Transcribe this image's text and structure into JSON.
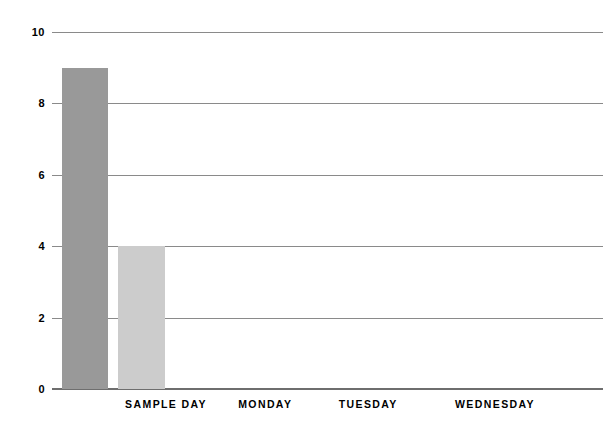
{
  "chart_data": {
    "type": "bar",
    "title": "",
    "subtitle": "",
    "xlabel": "",
    "ylabel": "",
    "categories": [
      "SAMPLE DAY",
      "MONDAY",
      "TUESDAY",
      "WEDNESDAY"
    ],
    "series": [
      {
        "name": "series-1",
        "color": "#999999",
        "values": [
          9,
          null,
          null,
          null
        ]
      },
      {
        "name": "series-2",
        "color": "#cccccc",
        "values": [
          4,
          null,
          null,
          null
        ]
      }
    ],
    "ylim": [
      0,
      10
    ],
    "yticks": [
      0,
      2,
      4,
      6,
      8,
      10
    ],
    "ytick_labels": [
      "0",
      "2",
      "4",
      "6",
      "8",
      "10"
    ],
    "grid": true,
    "grid_color": "#8a8a8a",
    "baseline_color": "#6e6e6e",
    "legend": false,
    "legend_position": "none",
    "background": "#ffffff",
    "annotations": []
  },
  "axis": {
    "y_ticks": [
      {
        "value": 10,
        "label": "10"
      },
      {
        "value": 8,
        "label": "8"
      },
      {
        "value": 6,
        "label": "6"
      },
      {
        "value": 4,
        "label": "4"
      },
      {
        "value": 2,
        "label": "2"
      },
      {
        "value": 0,
        "label": "0"
      }
    ],
    "x_categories": [
      {
        "label": "SAMPLE DAY",
        "center_pct": 20.7
      },
      {
        "label": "MONDAY",
        "center_pct": 38.7
      },
      {
        "label": "TUESDAY",
        "center_pct": 57.4
      },
      {
        "label": "WEDNESDAY",
        "center_pct": 80.4
      }
    ]
  },
  "bars": [
    {
      "name": "bar-sample-day-series-1",
      "value": 9,
      "color": "#999999",
      "left_pct": 1.9,
      "width_pct": 8.2
    },
    {
      "name": "bar-sample-day-series-2",
      "value": 4,
      "color": "#cccccc",
      "left_pct": 12.0,
      "width_pct": 8.5
    }
  ]
}
